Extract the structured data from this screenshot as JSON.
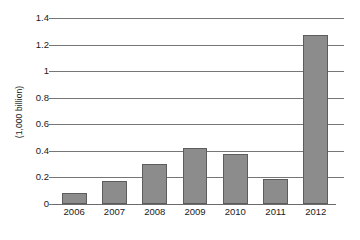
{
  "chart_data": {
    "type": "bar",
    "title": "",
    "subtitle": "",
    "xlabel": "",
    "ylabel": "(1,000 billion)",
    "categories": [
      "2006",
      "2007",
      "2008",
      "2009",
      "2010",
      "2011",
      "2012"
    ],
    "values": [
      0.08,
      0.17,
      0.3,
      0.42,
      0.375,
      0.185,
      1.27
    ],
    "series": [
      {
        "name": "",
        "values": [
          0.08,
          0.17,
          0.3,
          0.42,
          0.375,
          0.185,
          1.27
        ]
      }
    ],
    "ylim": [
      0,
      1.4
    ],
    "yticks": [
      0,
      0.2,
      0.4,
      0.6,
      0.8,
      1,
      1.2,
      1.4
    ],
    "ytick_labels": [
      "0",
      "0.2",
      "0.4",
      "0.6",
      "0.8",
      "1",
      "1.2",
      "1.4"
    ],
    "grid": "horizontal",
    "legend": "none",
    "annotations": [],
    "colors": {
      "bar_fill": "#8c8c8c",
      "bar_stroke": "#5d5d5d",
      "gridline": "#767676",
      "axis_text": "#1a1a1a",
      "background": "#ffffff"
    }
  }
}
